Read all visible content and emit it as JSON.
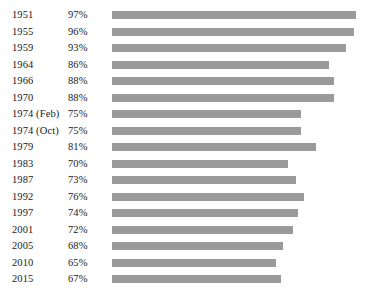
{
  "chart_data": {
    "type": "bar",
    "title": "",
    "subtitle": "",
    "xlabel": "",
    "ylabel": "",
    "orientation": "horizontal",
    "grid": false,
    "legend": false,
    "bar_color": "#9a9a9a",
    "background_color": "#ffffff",
    "text_color": "#1a1a1a",
    "axis_visible": false,
    "tick_labels_visible": false,
    "value_labels_position": "left-of-bars",
    "xlim": [
      0,
      100
    ],
    "unit": "%",
    "categories": [
      "1951",
      "1955",
      "1959",
      "1964",
      "1966",
      "1970",
      "1974 (Feb)",
      "1974 (Oct)",
      "1979",
      "1983",
      "1987",
      "1992",
      "1997",
      "2001",
      "2005",
      "2010",
      "2015"
    ],
    "values": [
      97,
      96,
      93,
      86,
      88,
      88,
      75,
      75,
      81,
      70,
      73,
      76,
      74,
      72,
      68,
      65,
      67
    ],
    "value_labels": [
      "97%",
      "96%",
      "93%",
      "86%",
      "88%",
      "88%",
      "75%",
      "75%",
      "81%",
      "70%",
      "73%",
      "76%",
      "74%",
      "72%",
      "68%",
      "65%",
      "67%"
    ]
  }
}
